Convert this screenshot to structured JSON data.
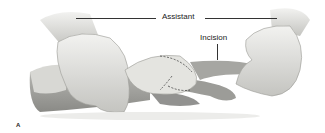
{
  "figure": {
    "labels": {
      "assistant": "Assistant",
      "incision": "Incision"
    },
    "panel_letter": "A",
    "colors": {
      "glove": "#e8e8e6",
      "glove_shadow": "#b8b8b4",
      "skin": "#a8a8a4",
      "label": "#222222"
    }
  }
}
